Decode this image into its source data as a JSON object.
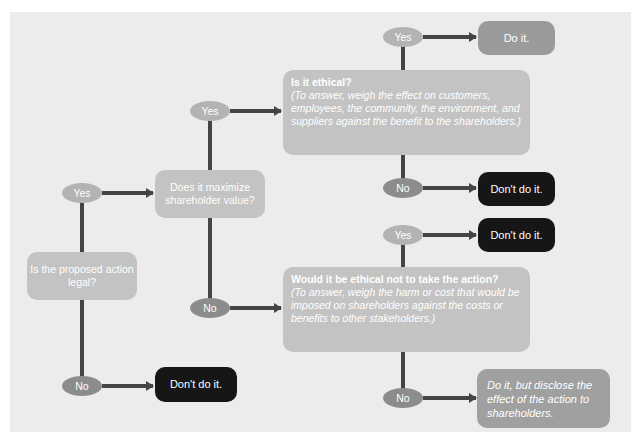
{
  "colors": {
    "background": "#ececec",
    "question_box": "#c3c3c3",
    "yes_oval": "#b3b3b3",
    "no_oval": "#8c8c8c",
    "do_box": "#9b9b9b",
    "dont_box": "#161616",
    "arrow": "#444444"
  },
  "nodes": {
    "legal": {
      "text": "Is the proposed action legal?"
    },
    "maximize": {
      "text": "Does it maximize shareholder value?"
    },
    "ethical": {
      "heading": "Is it ethical?",
      "note": "(To answer, weigh the effect on customers, employees, the community, the environment, and suppliers against the benefit to the shareholders.)"
    },
    "ethical_not": {
      "heading": "Would it be ethical not to take the action?",
      "note": "(To answer, weigh the harm or cost that would be imposed on shareholders against the costs or benefits to other stakeholders.)"
    }
  },
  "outcomes": {
    "legal_no": "Don't do it.",
    "ethical_yes": "Do it.",
    "ethical_no": "Don't do it.",
    "ethical_not_yes": "Don't do it.",
    "ethical_not_no": "Do it, but disclose the effect of the action to shareholders."
  },
  "labels": {
    "yes": "Yes",
    "no": "No"
  }
}
